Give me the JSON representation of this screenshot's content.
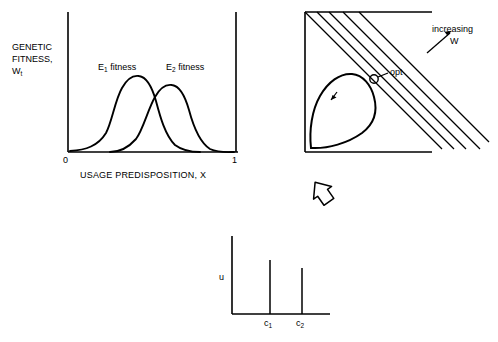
{
  "figure": {
    "title_absent": true,
    "panels": [
      {
        "id": "panel-a",
        "name": "genetic-fitness-vs-usage-predisposition",
        "y_axis_label_line1": "GENETIC",
        "y_axis_label_line2": "FITNESS,",
        "y_axis_label_line3": "W",
        "y_axis_label_sub": "t",
        "x_axis_label": "USAGE PREDISPOSITION, X",
        "x_tick_left": "0",
        "x_tick_right": "1",
        "curve1_label": "E",
        "curve1_label_sub": "1",
        "curve1_label_tail": " fitness",
        "curve2_label": "E",
        "curve2_label_sub": "2",
        "curve2_label_tail": " fitness"
      },
      {
        "id": "panel-b",
        "name": "fitness-set-with-adaptive-function",
        "arrow_label_line1": "increasing",
        "arrow_label_line2": "W",
        "opt_label": "opt",
        "inner_curve_marker": "↙"
      },
      {
        "id": "panel-c",
        "name": "utilization-spikes",
        "y_axis_label": "u",
        "spike1_label": "c",
        "spike1_label_sub": "1",
        "spike2_label": "c",
        "spike2_label_sub": "2"
      }
    ],
    "connector": {
      "name": "down-arrow",
      "glyph": "arrow-down-left"
    },
    "colors": {
      "ink": "#000000",
      "background": "#ffffff"
    }
  }
}
